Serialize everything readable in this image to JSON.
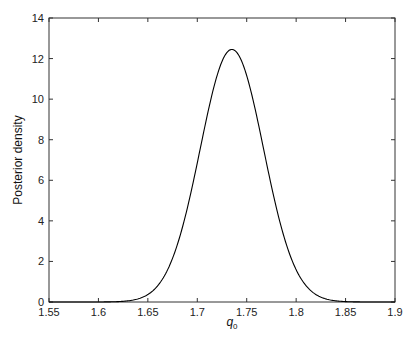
{
  "chart_data": {
    "type": "line",
    "title": "",
    "xlabel": "q",
    "xlabel_subscript": "0",
    "ylabel": "Posterior density",
    "xlim": [
      1.55,
      1.9
    ],
    "ylim": [
      0,
      14
    ],
    "xticks": [
      "1.55",
      "1.6",
      "1.65",
      "1.7",
      "1.75",
      "1.8",
      "1.85",
      "1.9"
    ],
    "yticks": [
      "0",
      "2",
      "4",
      "6",
      "8",
      "10",
      "12",
      "14"
    ],
    "grid": false,
    "legend": null,
    "series": [
      {
        "name": "posterior",
        "color": "#000000",
        "x": [
          1.55,
          1.6,
          1.62,
          1.64,
          1.65,
          1.66,
          1.67,
          1.68,
          1.69,
          1.7,
          1.71,
          1.72,
          1.73,
          1.735,
          1.74,
          1.75,
          1.76,
          1.77,
          1.78,
          1.79,
          1.8,
          1.81,
          1.82,
          1.84,
          1.86,
          1.9
        ],
        "y": [
          0,
          0.0,
          0.02,
          0.17,
          0.38,
          0.79,
          1.53,
          2.69,
          4.34,
          6.33,
          8.4,
          10.95,
          12.34,
          12.45,
          12.33,
          11.11,
          9.01,
          6.58,
          4.34,
          2.69,
          1.53,
          0.79,
          0.38,
          0.06,
          0.01,
          0
        ]
      }
    ],
    "peak": {
      "x": 1.735,
      "y": 12.45
    }
  }
}
